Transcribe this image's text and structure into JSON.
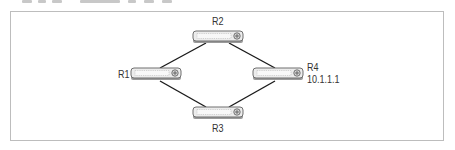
{
  "diagram": {
    "type": "network-topology",
    "colors": {
      "frame": "#bdbdbd",
      "link": "#1a1a1a",
      "router_body": "#e6e6e6",
      "router_outline": "#6f6f6f",
      "label": "#333333"
    },
    "routers": [
      {
        "id": "R1",
        "label": "R1",
        "address": ""
      },
      {
        "id": "R2",
        "label": "R2",
        "address": ""
      },
      {
        "id": "R3",
        "label": "R3",
        "address": ""
      },
      {
        "id": "R4",
        "label": "R4",
        "address": "10.1.1.1"
      }
    ],
    "links": [
      {
        "from": "R2",
        "to": "R1"
      },
      {
        "from": "R2",
        "to": "R4"
      },
      {
        "from": "R1",
        "to": "R3"
      },
      {
        "from": "R4",
        "to": "R3"
      }
    ],
    "icon": "router-icon"
  }
}
